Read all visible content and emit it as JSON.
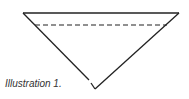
{
  "caption": "Illustration 1.",
  "diagram": {
    "shape": "inverted-triangle",
    "top_left": [
      23,
      13
    ],
    "top_right": [
      179,
      13
    ],
    "bottom": [
      95,
      89
    ],
    "dashed_line": {
      "y": 25,
      "x1": 35,
      "x2": 167
    },
    "stroke_color": "#222222"
  }
}
